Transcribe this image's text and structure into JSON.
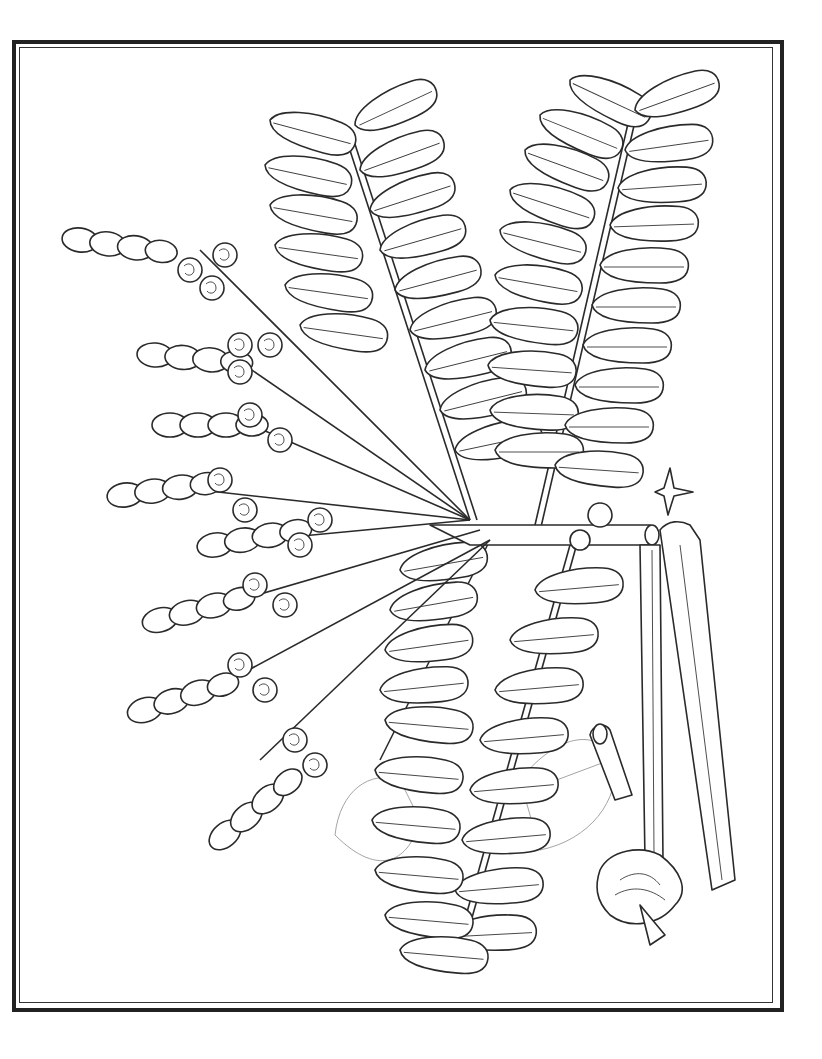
{
  "page": {
    "type": "botanical line-art coloring page",
    "background_color": "#ffffff",
    "line_color": "#2a2a2a"
  },
  "frame": {
    "style": "double border",
    "outer_color": "#222222",
    "inner_color": "#333333"
  },
  "drawing": {
    "compound_leaves": [
      {
        "name": "upper-left-leaf",
        "leaflet_pairs": 11
      },
      {
        "name": "upper-right-leaf",
        "leaflet_pairs": 13
      },
      {
        "name": "lower-left-leaf",
        "leaflet_pairs": 10
      },
      {
        "name": "lower-right-leaf",
        "leaflet_pairs": 10
      }
    ],
    "flower_racemes": 8,
    "seed_pods": 2,
    "details": [
      "four-pointed star bract",
      "tubular flower section",
      "open flower",
      "faint background heart-shaped leaf"
    ]
  }
}
